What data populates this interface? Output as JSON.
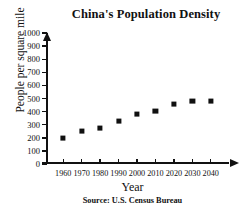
{
  "chart_data": {
    "type": "scatter",
    "title": "China's Population Density",
    "xlabel": "Year",
    "ylabel": "People per square mile",
    "source": "Source: U.S. Census Bureau",
    "categories": [
      1960,
      1970,
      1980,
      1990,
      2000,
      2010,
      2020,
      2030,
      2040
    ],
    "x_tick_labels": [
      "1960",
      "1970",
      "1980",
      "1990",
      "2000",
      "2010",
      "2020",
      "2030",
      "2040"
    ],
    "values": [
      200,
      250,
      275,
      330,
      380,
      405,
      455,
      480,
      480
    ],
    "y_tick_labels": [
      "0",
      "100",
      "200",
      "300",
      "400",
      "500",
      "600",
      "700",
      "800",
      "900",
      "1000"
    ],
    "y_ticks": [
      0,
      100,
      200,
      300,
      400,
      500,
      600,
      700,
      800,
      900,
      1000
    ],
    "ylim": [
      0,
      1000
    ],
    "xlim": [
      1955,
      2045
    ],
    "grid": false,
    "legend": "none",
    "marker": "filled-square",
    "marker_color": "#101010",
    "background_color": "#ffffff",
    "axis_color": "#111111"
  }
}
